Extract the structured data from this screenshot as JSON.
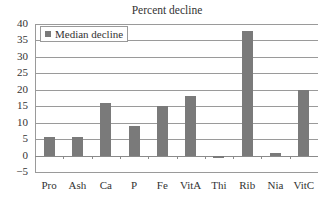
{
  "chart_data": {
    "type": "bar",
    "title": "Percent decline",
    "xlabel": "",
    "ylabel": "",
    "ylim": [
      -5,
      40
    ],
    "yticks": [
      40,
      35,
      30,
      25,
      20,
      15,
      10,
      5,
      0,
      -5
    ],
    "ytick_labels": [
      "40",
      "35",
      "30",
      "25",
      "20",
      "15",
      "10",
      "5",
      "0",
      "−5"
    ],
    "grid": true,
    "legend_position": "upper-left",
    "categories": [
      "Pro",
      "Ash",
      "Ca",
      "P",
      "Fe",
      "VitA",
      "Thi",
      "Rib",
      "Nia",
      "VitC"
    ],
    "series": [
      {
        "name": "Median decline",
        "color": "#7a7a7a",
        "values": [
          5.7,
          5.7,
          16,
          9,
          15,
          18,
          -0.8,
          38,
          0.7,
          20
        ]
      }
    ]
  },
  "legend": {
    "label": "Median decline"
  }
}
